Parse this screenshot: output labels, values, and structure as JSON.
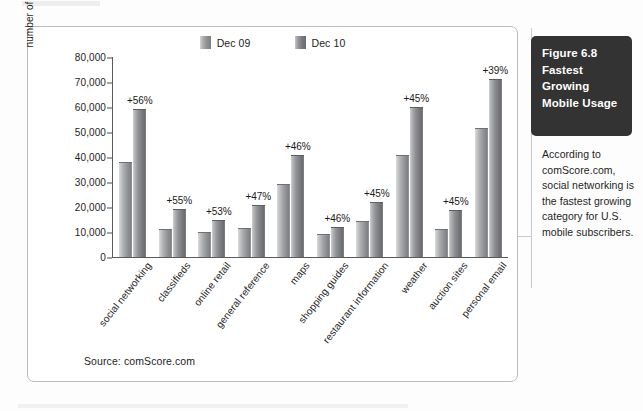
{
  "figure": {
    "box_title": "Figure 6.8 Fastest Growing Mobile Usage",
    "caption": "According to comScore.com, social networking is the fastest growing category for U.S. mobile subscribers."
  },
  "source_note": "Source: comScore.com",
  "colors": {
    "series_dec09": "#8d8f92",
    "series_dec10": "#77797d",
    "figure_box_bg": "#333333",
    "panel_border": "#b9bcc0",
    "axis": "#5a5a5a"
  },
  "chart_data": {
    "type": "bar",
    "title": "",
    "xlabel": "",
    "ylabel": "number of U.S. users",
    "ylim": [
      0,
      80000
    ],
    "yticks": [
      0,
      10000,
      20000,
      30000,
      40000,
      50000,
      60000,
      70000,
      80000
    ],
    "ytick_labels": [
      "0",
      "10,000",
      "20,000",
      "30,000",
      "40,000",
      "50,000",
      "60,000",
      "70,000",
      "80,000"
    ],
    "grid": false,
    "legend_position": "top-center",
    "categories": [
      "social networking",
      "classifieds",
      "online retail",
      "general reference",
      "maps",
      "shopping guides",
      "restaurant information",
      "weather",
      "auction sites",
      "personal email"
    ],
    "series": [
      {
        "name": "Dec 09",
        "values": [
          37500,
          10800,
          9700,
          11400,
          29000,
          8900,
          14200,
          40500,
          10800,
          51200
        ]
      },
      {
        "name": "Dec 10",
        "values": [
          58800,
          19000,
          14500,
          20500,
          40500,
          11700,
          21600,
          59500,
          18400,
          70700
        ]
      }
    ],
    "annotations": [
      "+56%",
      "+55%",
      "+53%",
      "+47%",
      "+46%",
      "+46%",
      "+45%",
      "+45%",
      "+45%",
      "+39%"
    ]
  }
}
